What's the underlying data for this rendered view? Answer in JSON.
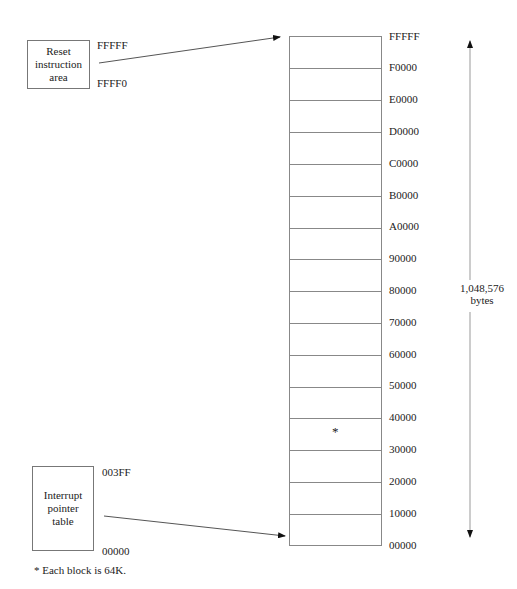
{
  "reset_box": {
    "label_lines": [
      "Reset",
      "instruction",
      "area"
    ],
    "addr_top": "FFFFF",
    "addr_bottom": "FFFF0"
  },
  "interrupt_box": {
    "label_lines": [
      "Interrupt",
      "pointer",
      "table"
    ],
    "addr_top": "003FF",
    "addr_bottom": "00000"
  },
  "memory_map": {
    "block_count": 16,
    "addresses": [
      "FFFFF",
      "F0000",
      "E0000",
      "D0000",
      "C0000",
      "B0000",
      "A0000",
      "90000",
      "80000",
      "70000",
      "60000",
      "50000",
      "40000",
      "30000",
      "20000",
      "10000",
      "00000"
    ],
    "marked_block_symbol": "*"
  },
  "size_span": {
    "value": "1,048,576",
    "unit": "bytes"
  },
  "footnote": "* Each block is 64K.",
  "colors": {
    "line": "#888888",
    "text": "#222222",
    "arrow": "#111111"
  }
}
